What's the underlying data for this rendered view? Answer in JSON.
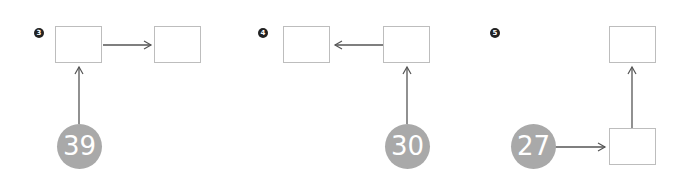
{
  "panels": [
    {
      "marker": "3",
      "number": "39",
      "direction": "input from below into left box, arrow to right box"
    },
    {
      "marker": "4",
      "number": "30",
      "direction": "input from below into right box, arrow to left box"
    },
    {
      "marker": "5",
      "number": "27",
      "direction": "input from left into bottom box, arrow up to top box"
    }
  ],
  "colors": {
    "circle": "#a9a9a9",
    "box_border": "#bdbdbd",
    "arrow": "#555555",
    "marker": "#222222"
  }
}
